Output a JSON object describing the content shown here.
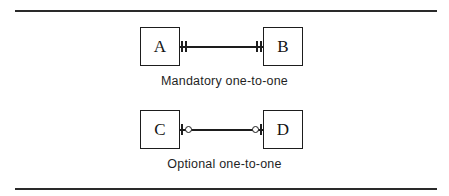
{
  "figure": {
    "name": "er-cardinality-notation-figure",
    "background_color": "#ffffff",
    "line_color": "#1d1d1d",
    "rules": {
      "top_label": "top-horizontal-rule",
      "bottom_label": "bottom-horizontal-rule"
    }
  },
  "diagrams": [
    {
      "caption": "Mandatory one-to-one",
      "left_entity": "A",
      "right_entity": "B",
      "left_cardinality": "one-and-only-one",
      "right_cardinality": "one-and-only-one",
      "left_symbol": "double-tick",
      "right_symbol": "double-tick"
    },
    {
      "caption": "Optional one-to-one",
      "left_entity": "C",
      "right_entity": "D",
      "left_cardinality": "zero-or-one",
      "right_cardinality": "zero-or-one",
      "left_symbol": "tick-and-circle",
      "right_symbol": "circle-and-tick"
    }
  ]
}
